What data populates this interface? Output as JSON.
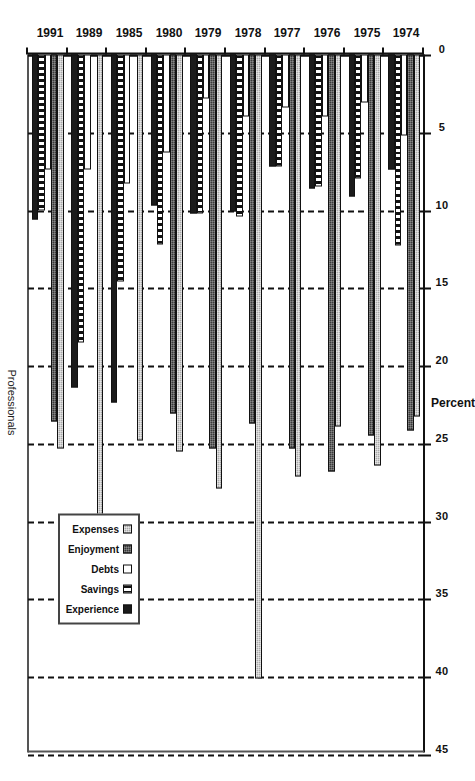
{
  "figure": {
    "caption": "Professionals",
    "value_axis_title": "Percent"
  },
  "chart_data": {
    "type": "bar",
    "orientation": "horizontal-grouped",
    "title": "Professionals",
    "xlabel": "Percent",
    "ylabel": "",
    "xlim": [
      0,
      45
    ],
    "xticks": [
      0,
      5,
      10,
      15,
      20,
      25,
      30,
      35,
      40,
      45
    ],
    "xtick_labels": [
      "0",
      "5",
      "10",
      "15",
      "20",
      "25",
      "30",
      "35",
      "40",
      "45"
    ],
    "grid": true,
    "legend_position": "bottom-right",
    "categories": [
      "1974",
      "1975",
      "1976",
      "1977",
      "1978",
      "1979",
      "1980",
      "1985",
      "1989",
      "1991"
    ],
    "series": [
      {
        "name": "Expenses",
        "swatch": "#a9a9a9",
        "values": [
          23.3,
          26.4,
          23.9,
          27.1,
          40.1,
          27.9,
          25.5,
          24.8,
          30.2,
          25.3
        ]
      },
      {
        "name": "Enjoyment",
        "swatch": "#3a3a3a",
        "values": [
          24.2,
          24.5,
          26.8,
          25.3,
          23.7,
          25.3,
          23.1,
          0,
          0,
          23.6
        ]
      },
      {
        "name": "Debts",
        "swatch": "#ffffff",
        "values": [
          5.2,
          3.1,
          4.0,
          3.4,
          4.0,
          2.8,
          6.3,
          8.3,
          7.4,
          7.4
        ]
      },
      {
        "name": "Savings",
        "swatch": "#ffffff",
        "values": [
          12.3,
          8.0,
          8.5,
          7.2,
          10.4,
          10.2,
          12.2,
          14.6,
          18.5,
          10.0
        ]
      },
      {
        "name": "Experience",
        "swatch": "#1b1b1b",
        "values": [
          7.4,
          9.1,
          8.6,
          7.2,
          10.1,
          10.2,
          9.7,
          22.4,
          21.4,
          10.6
        ]
      }
    ]
  },
  "legend": {
    "entries": [
      {
        "label": "Expenses",
        "key": "expenses"
      },
      {
        "label": "Enjoyment",
        "key": "enjoyment"
      },
      {
        "label": "Debts",
        "key": "debts"
      },
      {
        "label": "Savings",
        "key": "savings"
      },
      {
        "label": "Experience",
        "key": "experience"
      }
    ]
  }
}
